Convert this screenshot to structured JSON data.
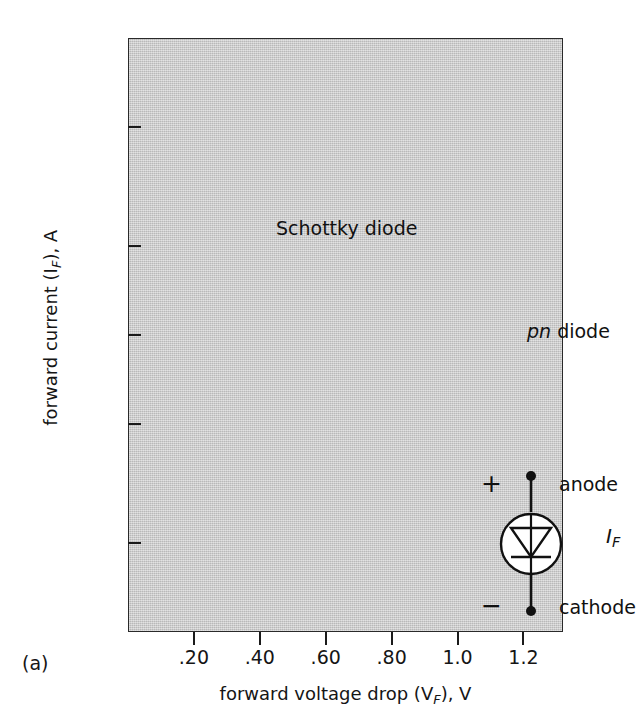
{
  "figure": {
    "caption": "(a)",
    "plot_bg_color": "#c9c9c9",
    "ink_color": "#151515"
  },
  "axes": {
    "y": {
      "title_text": "forward current (I",
      "title_sub": "F",
      "title_tail": "), A",
      "scale": "log",
      "range": [
        1,
        100
      ],
      "ticks": [
        {
          "value": 100,
          "label": "100"
        },
        {
          "value": 50,
          "label": "50"
        },
        {
          "value": 20,
          "label": "20"
        },
        {
          "value": 10,
          "label": "10"
        },
        {
          "value": 5,
          "label": "5"
        },
        {
          "value": 2,
          "label": "2"
        },
        {
          "value": 1,
          "label": "1"
        }
      ]
    },
    "x": {
      "title_text": "forward voltage drop (V",
      "title_sub": "F",
      "title_tail": "), V",
      "scale": "linear",
      "range": [
        0.0,
        1.32
      ],
      "ticks": [
        {
          "value": 0.2,
          "label": ".20"
        },
        {
          "value": 0.4,
          "label": ".40"
        },
        {
          "value": 0.6,
          "label": ".60"
        },
        {
          "value": 0.8,
          "label": ".80"
        },
        {
          "value": 1.0,
          "label": "1.0"
        },
        {
          "value": 1.2,
          "label": "1.2"
        }
      ]
    }
  },
  "annotations": {
    "schottky_label": "Schottky diode",
    "pn_label_italic": "pn",
    "pn_label_rest": " diode",
    "anode_label": "anode",
    "cathode_label": "cathode",
    "plus_sign": "+",
    "minus_sign": "−",
    "current_symbol_italic": "I",
    "current_symbol_sub": "F"
  },
  "chart_data": {
    "type": "scatter",
    "title": "",
    "subtitle": "",
    "xlabel": "forward voltage drop (VF), V",
    "ylabel": "forward current (IF), A",
    "xlim": [
      0.0,
      1.32
    ],
    "ylim": [
      1,
      100
    ],
    "yscale": "log",
    "xscale": "linear",
    "grid": false,
    "legend": "none",
    "xticks": [
      0.2,
      0.4,
      0.6,
      0.8,
      1.0,
      1.2
    ],
    "xticklabels": [
      ".20",
      ".40",
      ".60",
      ".80",
      "1.0",
      "1.2"
    ],
    "yticks": [
      1,
      2,
      5,
      10,
      20,
      50,
      100
    ],
    "yticklabels": [
      "1",
      "2",
      "5",
      "10",
      "20",
      "50",
      "100"
    ],
    "series": [],
    "text_annotations": [
      {
        "text": "Schottky diode",
        "x": 0.13,
        "y": 32,
        "style": "plain"
      },
      {
        "text": "pn diode",
        "x": 0.89,
        "y": 14,
        "style": "pn-italic"
      },
      {
        "text": "anode",
        "x": 1.0,
        "y": 4.6,
        "style": "plain"
      },
      {
        "text": "cathode",
        "x": 1.0,
        "y": 2.0,
        "style": "plain"
      },
      {
        "text": "+",
        "x": 0.76,
        "y": 4.7,
        "style": "plain"
      },
      {
        "text": "−",
        "x": 0.76,
        "y": 2.05,
        "style": "plain"
      },
      {
        "text": "IF",
        "x": 1.12,
        "y": 3.0,
        "style": "italic-sub"
      }
    ],
    "schematic": {
      "kind": "diode-symbol-in-circle",
      "anode_node_x": 0.91,
      "anode_node_y": 4.6,
      "cathode_node_x": 0.91,
      "cathode_node_y": 2.0,
      "circle_center_x": 0.91,
      "circle_center_y": 3.0
    }
  }
}
